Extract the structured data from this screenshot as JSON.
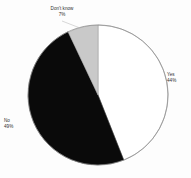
{
  "figure": {
    "background_color": "#fdfdfd",
    "outline_color": "#8d8d8d",
    "leader_line_color": "#b4b4b4"
  },
  "chart_data": {
    "type": "pie",
    "title": "",
    "subtitle": "",
    "xlabel": "",
    "ylabel": "",
    "grid": false,
    "legend_position": "none",
    "label_style": "outside-with-leader",
    "start_angle_deg": 0,
    "direction": "clockwise",
    "total_percent": 100,
    "categories": [
      "Yes",
      "No",
      "Don't know"
    ],
    "values": [
      44,
      49,
      7
    ],
    "value_suffix": "%",
    "colors": [
      "#ffffff",
      "#0a0a0a",
      "#c9c9c9"
    ],
    "slices": [
      {
        "label": "Yes",
        "value": 44,
        "value_text": "44%",
        "color": "#ffffff",
        "start_angle_deg": 0,
        "end_angle_deg": 158.4
      },
      {
        "label": "No",
        "value": 49,
        "value_text": "49%",
        "color": "#0a0a0a",
        "start_angle_deg": 158.4,
        "end_angle_deg": 334.8
      },
      {
        "label": "Don't know",
        "value": 7,
        "value_text": "7%",
        "color": "#c9c9c9",
        "start_angle_deg": 334.8,
        "end_angle_deg": 360
      }
    ]
  },
  "labels": {
    "dont_know": {
      "name": "Don't know",
      "value_text": "7%"
    },
    "yes": {
      "name": "Yes",
      "value_text": "44%"
    },
    "no": {
      "name": "No",
      "value_text": "49%"
    }
  }
}
